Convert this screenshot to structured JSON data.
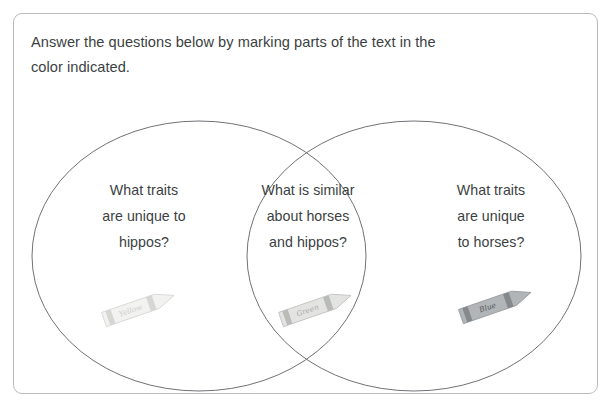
{
  "worksheet": {
    "instructions": {
      "line1": "Answer the questions below by marking parts of the text in the",
      "line2": "color indicated."
    },
    "venn": {
      "left_region": {
        "line1": "What traits",
        "line2": "are unique to",
        "line3": "hippos?"
      },
      "center_region": {
        "line1": "What is similar",
        "line2": "about horses",
        "line3": "and hippos?"
      },
      "right_region": {
        "line1": "What traits",
        "line2": "are unique",
        "line3": "to horses?"
      }
    },
    "crayons": [
      {
        "label": "Yellow",
        "body_color": "#f2f2f0",
        "band_color": "#d6d6d4",
        "outline_color": "#d9d9d7"
      },
      {
        "label": "Green",
        "body_color": "#e3e4e2",
        "band_color": "#b9bbb9",
        "outline_color": "#c6c7c5"
      },
      {
        "label": "Blue",
        "body_color": "#b2b5b7",
        "band_color": "#85898c",
        "outline_color": "#9aa0a3"
      }
    ],
    "colors": {
      "frame_border": "#b9bcbe",
      "circle_stroke": "#6f7276",
      "text": "#3b3f42",
      "background": "#ffffff"
    }
  }
}
